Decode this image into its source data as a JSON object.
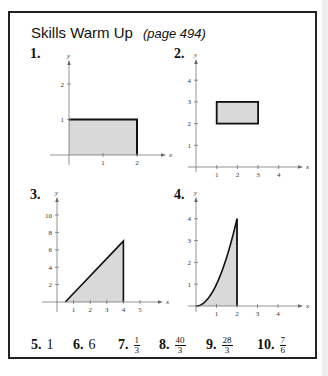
{
  "heading": {
    "title": "Skills Warm Up",
    "page_ref": "(page 494)"
  },
  "chart_data": [
    {
      "id": "1",
      "label": "1.",
      "type": "area",
      "description": "Shaded rectangle under y = 1 from x = 0 to x = 2",
      "region": {
        "kind": "rectangle",
        "x": [
          0,
          2
        ],
        "y": [
          0,
          1
        ]
      },
      "xlabel": "x",
      "ylabel": "y",
      "xticks": [
        1,
        2
      ],
      "yticks": [
        1,
        2
      ],
      "xlim": [
        -0.5,
        2.6
      ],
      "ylim": [
        -0.3,
        2.7
      ]
    },
    {
      "id": "2",
      "label": "2.",
      "type": "area",
      "description": "Shaded rectangle from x = 1 to 3, y = 2 to 3",
      "region": {
        "kind": "rectangle",
        "x": [
          1,
          3
        ],
        "y": [
          2,
          3
        ]
      },
      "xlabel": "x",
      "ylabel": "y",
      "xticks": [
        1,
        2,
        3,
        4
      ],
      "yticks": [
        1,
        2,
        3,
        4
      ],
      "xlim": [
        0,
        5
      ],
      "ylim": [
        0,
        5
      ]
    },
    {
      "id": "3",
      "label": "3.",
      "type": "area",
      "description": "Shaded triangle under line from (0.5, 0) to (4, 7)",
      "region": {
        "kind": "polygon",
        "points": [
          [
            0.5,
            0
          ],
          [
            4,
            7
          ],
          [
            4,
            0
          ]
        ]
      },
      "xlabel": "x",
      "ylabel": "y",
      "xticks": [
        1,
        2,
        3,
        4,
        5
      ],
      "yticks": [
        2,
        4,
        6,
        8,
        10
      ],
      "xlim": [
        -0.5,
        6
      ],
      "ylim": [
        0,
        12
      ]
    },
    {
      "id": "4",
      "label": "4.",
      "type": "area",
      "description": "Shaded region under y = x^2 from x = 0 to x = 2",
      "region": {
        "kind": "function",
        "fn": "x^2",
        "x": [
          0,
          2
        ]
      },
      "xlabel": "x",
      "ylabel": "y",
      "xticks": [
        1,
        2,
        3,
        4
      ],
      "yticks": [
        1,
        2,
        3,
        4
      ],
      "xlim": [
        0,
        5
      ],
      "ylim": [
        0,
        5
      ]
    }
  ],
  "answers": [
    {
      "label": "5.",
      "value": "1"
    },
    {
      "label": "6.",
      "value": "6"
    },
    {
      "label": "7.",
      "num": "1",
      "den": "3"
    },
    {
      "label": "8.",
      "num": "40",
      "den": "3"
    },
    {
      "label": "9.",
      "num": "28",
      "den": "3"
    },
    {
      "label": "10.",
      "num": "7",
      "den": "6"
    }
  ],
  "colors": {
    "fill": "#d9d9d9",
    "stroke": "#111111",
    "axis": "#666666"
  }
}
